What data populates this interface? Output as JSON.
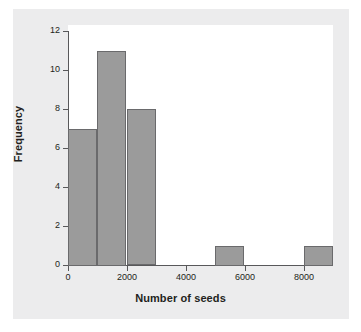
{
  "chart_data": {
    "type": "bar",
    "title": "",
    "xlabel": "Number of seeds",
    "ylabel": "Frequency",
    "grid": false,
    "legend": "none",
    "xlim": [
      0,
      9000
    ],
    "ylim": [
      0,
      12
    ],
    "bin_width": 1000,
    "x_ticks": [
      "0",
      "2000",
      "4000",
      "6000",
      "8000"
    ],
    "x_tick_values": [
      0,
      2000,
      4000,
      6000,
      8000
    ],
    "y_ticks": [
      "0",
      "2",
      "4",
      "6",
      "8",
      "10",
      "12"
    ],
    "y_tick_values": [
      0,
      2,
      4,
      6,
      8,
      10,
      12
    ],
    "categories": [
      "0-1000",
      "1000-2000",
      "2000-3000",
      "3000-4000",
      "4000-5000",
      "5000-6000",
      "6000-7000",
      "7000-8000",
      "8000-9000"
    ],
    "bin_starts": [
      0,
      1000,
      2000,
      3000,
      4000,
      5000,
      6000,
      7000,
      8000
    ],
    "values": [
      7,
      11,
      8,
      0,
      0,
      1,
      0,
      0,
      1
    ],
    "bar_color": "#9b9b9b",
    "bar_edge_color": "#6a6a6c",
    "plot_background": "#ffffff",
    "figure_background": "#ececed",
    "axis_color": "#58585a",
    "text_color": "#231f20"
  }
}
